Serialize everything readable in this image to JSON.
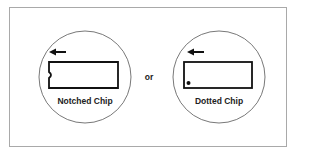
{
  "diagram": {
    "left": {
      "label": "Notched Chip",
      "marker": "notch",
      "arrow_direction": "left"
    },
    "connector": "or",
    "right": {
      "label": "Dotted Chip",
      "marker": "dot",
      "arrow_direction": "left"
    }
  },
  "colors": {
    "stroke": "#111111",
    "circle": "#555555",
    "frame": "#a9a9a9"
  }
}
